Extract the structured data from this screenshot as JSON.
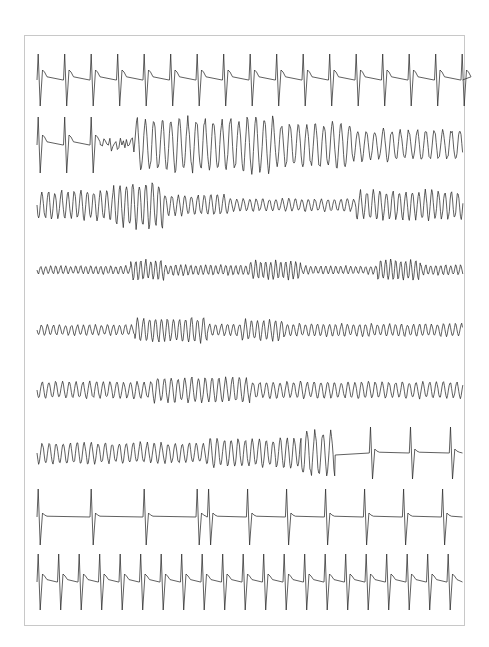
{
  "figure": {
    "type": "ecg-rhythm-strips",
    "frame": {
      "x": 24,
      "y": 35,
      "width": 441,
      "height": 591,
      "border_color": "#c8c8c8"
    },
    "trace_color": "#2b2b2b",
    "x_start": 37,
    "x_end": 463,
    "strips": [
      {
        "id": "strip-1",
        "baseline": 80,
        "segments": [
          {
            "kind": "qrs",
            "from": 0,
            "to": 1,
            "rate": 26.5,
            "amp": 26,
            "depth": 26,
            "tail": 8
          }
        ]
      },
      {
        "id": "strip-2",
        "baseline": 145,
        "segments": [
          {
            "kind": "qrs",
            "from": 0,
            "to": 0.15,
            "rate": 26.5,
            "amp": 28,
            "depth": 28,
            "tail": 8
          },
          {
            "kind": "noise",
            "from": 0.15,
            "to": 0.23,
            "period": 6,
            "amp": 8
          },
          {
            "kind": "sine",
            "from": 0.23,
            "to": 0.56,
            "period": 8.5,
            "amp": 26
          },
          {
            "kind": "sine",
            "from": 0.56,
            "to": 0.74,
            "period": 8.5,
            "amp": 22
          },
          {
            "kind": "sine",
            "from": 0.74,
            "to": 1,
            "period": 8.5,
            "amp": 15
          }
        ]
      },
      {
        "id": "strip-3",
        "baseline": 205,
        "segments": [
          {
            "kind": "sine",
            "from": 0,
            "to": 0.18,
            "period": 6.5,
            "amp": 14
          },
          {
            "kind": "sine",
            "from": 0.18,
            "to": 0.3,
            "period": 6.5,
            "amp": 22
          },
          {
            "kind": "sine",
            "from": 0.3,
            "to": 0.45,
            "period": 6.5,
            "amp": 10
          },
          {
            "kind": "sine",
            "from": 0.45,
            "to": 0.75,
            "period": 6.5,
            "amp": 6
          },
          {
            "kind": "sine",
            "from": 0.75,
            "to": 1,
            "period": 6.5,
            "amp": 14
          }
        ]
      },
      {
        "id": "strip-4",
        "baseline": 270,
        "segments": [
          {
            "kind": "sine",
            "from": 0,
            "to": 0.22,
            "period": 5,
            "amp": 4
          },
          {
            "kind": "sine",
            "from": 0.22,
            "to": 0.3,
            "period": 5,
            "amp": 10
          },
          {
            "kind": "sine",
            "from": 0.3,
            "to": 0.5,
            "period": 5,
            "amp": 5
          },
          {
            "kind": "sine",
            "from": 0.5,
            "to": 0.62,
            "period": 5,
            "amp": 9
          },
          {
            "kind": "sine",
            "from": 0.62,
            "to": 0.8,
            "period": 5,
            "amp": 4
          },
          {
            "kind": "sine",
            "from": 0.8,
            "to": 0.9,
            "period": 5,
            "amp": 10
          },
          {
            "kind": "sine",
            "from": 0.9,
            "to": 1,
            "period": 5,
            "amp": 5
          }
        ]
      },
      {
        "id": "strip-5",
        "baseline": 330,
        "segments": [
          {
            "kind": "sine",
            "from": 0,
            "to": 0.23,
            "period": 6,
            "amp": 5
          },
          {
            "kind": "sine",
            "from": 0.23,
            "to": 0.4,
            "period": 6,
            "amp": 12
          },
          {
            "kind": "sine",
            "from": 0.4,
            "to": 0.48,
            "period": 6,
            "amp": 6
          },
          {
            "kind": "sine",
            "from": 0.48,
            "to": 0.58,
            "period": 6,
            "amp": 10
          },
          {
            "kind": "sine",
            "from": 0.58,
            "to": 1,
            "period": 6,
            "amp": 6
          }
        ]
      },
      {
        "id": "strip-6",
        "baseline": 390,
        "segments": [
          {
            "kind": "sine",
            "from": 0,
            "to": 0.27,
            "period": 6.8,
            "amp": 8
          },
          {
            "kind": "sine",
            "from": 0.27,
            "to": 0.5,
            "period": 6.8,
            "amp": 12
          },
          {
            "kind": "sine",
            "from": 0.5,
            "to": 1,
            "period": 6.8,
            "amp": 8
          }
        ]
      },
      {
        "id": "strip-7",
        "baseline": 453,
        "segments": [
          {
            "kind": "sine",
            "from": 0,
            "to": 0.4,
            "period": 7,
            "amp": 10
          },
          {
            "kind": "sine",
            "from": 0.4,
            "to": 0.62,
            "period": 7,
            "amp": 14
          },
          {
            "kind": "sine",
            "from": 0.62,
            "to": 0.7,
            "period": 8,
            "amp": 22
          },
          {
            "kind": "flat",
            "from": 0.7,
            "to": 0.78
          },
          {
            "kind": "qrs",
            "from": 0.78,
            "to": 1,
            "rate": 40,
            "amp": 26,
            "depth": 26,
            "tail": 2
          }
        ]
      },
      {
        "id": "strip-8",
        "baseline": 517,
        "segments": [
          {
            "kind": "qrs",
            "from": 0,
            "to": 0.4,
            "rate": 53,
            "amp": 28,
            "depth": 28,
            "tail": 2
          },
          {
            "kind": "qrs",
            "from": 0.4,
            "to": 1,
            "rate": 39,
            "amp": 28,
            "depth": 28,
            "tail": 2
          }
        ]
      },
      {
        "id": "strip-9",
        "baseline": 582,
        "segments": [
          {
            "kind": "qrs",
            "from": 0,
            "to": 1,
            "rate": 20.5,
            "amp": 28,
            "depth": 28,
            "tail": 6
          }
        ]
      }
    ]
  }
}
